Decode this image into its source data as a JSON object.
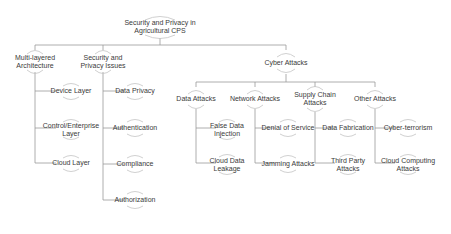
{
  "diagram": {
    "title": "Security and Privacy in Agricultural CPS",
    "colors": {
      "background": "#ffffff",
      "text": "#3a3a3a",
      "connector": "#9a9a9a",
      "arc": "#c4c4c4"
    },
    "root": {
      "label_line1": "Security and Privacy in",
      "label_line2": "Agricultural CPS"
    },
    "level1": {
      "multi_layered": {
        "label_line1": "Multi-layered",
        "label_line2": "Architecture"
      },
      "security_privacy": {
        "label_line1": "Security and",
        "label_line2": "Privacy Issues"
      },
      "cyber_attacks": {
        "label_line1": "Cyber Attacks"
      }
    },
    "multi_layered_children": [
      {
        "label_line1": "Device Layer"
      },
      {
        "label_line1": "Control/Enterprise",
        "label_line2": "Layer"
      },
      {
        "label_line1": "Cloud Layer"
      }
    ],
    "security_privacy_children": [
      {
        "label_line1": "Data Privacy"
      },
      {
        "label_line1": "Authentication"
      },
      {
        "label_line1": "Compliance"
      },
      {
        "label_line1": "Authorization"
      }
    ],
    "cyber_attacks_children": {
      "data_attacks": {
        "label_line1": "Data Attacks"
      },
      "network_attacks": {
        "label_line1": "Network Attacks"
      },
      "supply_chain_attacks": {
        "label_line1": "Supply Chain",
        "label_line2": "Attacks"
      },
      "other_attacks": {
        "label_line1": "Other Attacks"
      }
    },
    "data_attacks_children": [
      {
        "label_line1": "False Data",
        "label_line2": "Injection"
      },
      {
        "label_line1": "Cloud Data",
        "label_line2": "Leakage"
      }
    ],
    "network_attacks_children": [
      {
        "label_line1": "Denial of Service"
      },
      {
        "label_line1": "Jamming Attacks"
      }
    ],
    "supply_chain_children": [
      {
        "label_line1": "Data Fabrication"
      },
      {
        "label_line1": "Third Party",
        "label_line2": "Attacks"
      }
    ],
    "other_attacks_children": [
      {
        "label_line1": "Cyber-terrorism"
      },
      {
        "label_line1": "Cloud Computing",
        "label_line2": "Attacks"
      }
    ]
  }
}
